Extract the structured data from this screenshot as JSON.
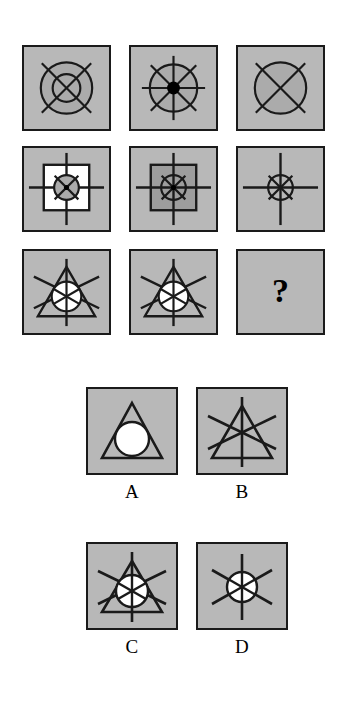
{
  "puzzle": {
    "type": "matrix-reasoning",
    "question_marker": "?",
    "matrix": {
      "rows": 3,
      "columns": 3,
      "cells": [
        {
          "position": "row1-col1",
          "description": "Two concentric circles with a diagonal X cross",
          "shapes": [
            "outer-circle",
            "inner-circle",
            "diagonal-cross"
          ],
          "center_dot": false,
          "inner_square": "none",
          "circle_fill": "gray"
        },
        {
          "position": "row1-col2",
          "description": "Circle with eight-spoke star and filled black center dot",
          "shapes": [
            "circle",
            "eight-spoke-star",
            "center-dot"
          ],
          "center_dot": true,
          "inner_square": "none",
          "circle_fill": "gray"
        },
        {
          "position": "row1-col3",
          "description": "Single circle with a diagonal X cross",
          "shapes": [
            "circle",
            "diagonal-cross"
          ],
          "center_dot": false,
          "inner_square": "none",
          "circle_fill": "gray"
        },
        {
          "position": "row2-col1",
          "description": "White inner square with small star-circle and long cross arms",
          "shapes": [
            "inner-square",
            "small-circle",
            "eight-spoke-star",
            "long-cross"
          ],
          "center_dot": true,
          "inner_square": "white",
          "circle_fill": "gray"
        },
        {
          "position": "row2-col2",
          "description": "Gray inner square with small star-circle and long cross arms",
          "shapes": [
            "inner-square",
            "small-circle",
            "eight-spoke-star",
            "long-cross"
          ],
          "center_dot": true,
          "inner_square": "gray",
          "circle_fill": "gray"
        },
        {
          "position": "row2-col3",
          "description": "Small star-circle with long cross arms, no inner square",
          "shapes": [
            "small-circle",
            "eight-spoke-star",
            "long-cross"
          ],
          "center_dot": false,
          "inner_square": "none",
          "circle_fill": "gray"
        },
        {
          "position": "row3-col1",
          "description": "Triangle with white circle and six-spoke star",
          "shapes": [
            "triangle",
            "white-circle",
            "six-spoke-star"
          ],
          "center_dot": false,
          "inner_square": "none",
          "circle_fill": "white"
        },
        {
          "position": "row3-col2",
          "description": "Triangle with white circle and six-spoke star",
          "shapes": [
            "triangle",
            "white-circle",
            "six-spoke-star"
          ],
          "center_dot": false,
          "inner_square": "none",
          "circle_fill": "white"
        },
        {
          "position": "row3-col3",
          "description": "Missing element, shown as a question mark",
          "shapes": [
            "question-mark"
          ],
          "center_dot": false,
          "inner_square": "none",
          "circle_fill": "none"
        }
      ]
    },
    "options": [
      {
        "label": "A",
        "description": "Triangle enclosing a plain white circle, no star spokes",
        "shapes": [
          "triangle",
          "white-circle"
        ]
      },
      {
        "label": "B",
        "description": "Triangle with six-spoke star, no circle",
        "shapes": [
          "triangle",
          "six-spoke-star"
        ]
      },
      {
        "label": "C",
        "description": "Triangle with white circle and six-spoke star",
        "shapes": [
          "triangle",
          "white-circle",
          "six-spoke-star"
        ]
      },
      {
        "label": "D",
        "description": "White circle with six-spoke star, no triangle",
        "shapes": [
          "white-circle",
          "six-spoke-star"
        ]
      }
    ],
    "colors": {
      "panel_background": "#b8b8b8",
      "panel_border": "#1a1a1a",
      "stroke": "#1a1a1a",
      "circle_fill_gray": "#ababab",
      "circle_fill_white": "#ffffff",
      "inner_square_white": "#ffffff",
      "inner_square_gray": "#9d9d9d",
      "page_background": "#ffffff",
      "text": "#000000"
    }
  }
}
